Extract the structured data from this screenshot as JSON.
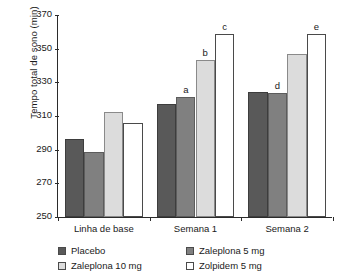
{
  "chart_data": {
    "type": "bar",
    "title": "",
    "xlabel": "",
    "ylabel": "Tempo total de sono (min)",
    "ylim": [
      250,
      370
    ],
    "yticks": [
      250,
      270,
      290,
      310,
      330,
      350,
      370
    ],
    "grid": false,
    "legend_position": "bottom",
    "categories": [
      "Linha de base",
      "Semana 1",
      "Semana 2"
    ],
    "series": [
      {
        "name": "Placebo",
        "color": "#595959",
        "values": [
          296.5,
          317.0,
          324.5
        ]
      },
      {
        "name": "Zaleplona 5 mg",
        "color": "#808080",
        "values": [
          288.5,
          321.0,
          323.5
        ]
      },
      {
        "name": "Zaleplona 10 mg",
        "color": "#dcdcdc",
        "values": [
          312.5,
          343.0,
          347.0
        ]
      },
      {
        "name": "Zolpidem 5 mg",
        "color": "#ffffff",
        "values": [
          306.0,
          358.5,
          358.5
        ]
      }
    ],
    "annotations": [
      {
        "label": "a",
        "category": "Semana 1",
        "series": "Zaleplona 5 mg",
        "value": 321.0
      },
      {
        "label": "b",
        "category": "Semana 1",
        "series": "Zaleplona 10 mg",
        "value": 343.0
      },
      {
        "label": "c",
        "category": "Semana 1",
        "series": "Zolpidem 5 mg",
        "value": 358.5
      },
      {
        "label": "d",
        "category": "Semana 2",
        "series": "Zaleplona 5 mg",
        "value": 323.5
      },
      {
        "label": "e",
        "category": "Semana 2",
        "series": "Zolpidem 5 mg",
        "value": 358.5
      }
    ]
  },
  "legend": {
    "items": [
      {
        "label": "Placebo"
      },
      {
        "label": "Zaleplona 5 mg"
      },
      {
        "label": "Zaleplona 10 mg"
      },
      {
        "label": "Zolpidem 5 mg"
      }
    ]
  }
}
